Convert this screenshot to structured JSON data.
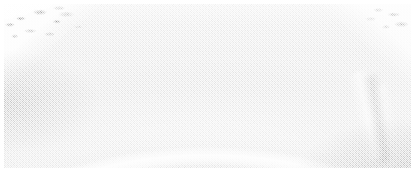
{
  "image": {
    "kind": "grayscale-noisy-micrograph",
    "width_px": 415,
    "height_px": 171,
    "border_color": "#ffffff",
    "border_px": 4,
    "alt": "Noisy grayscale image showing a broad dark dome bounded by a bright curved rim, with a secondary bright arc band below it and two thin bright streaks at right",
    "caption": ""
  },
  "tones": {
    "background_paper": "#ffffff",
    "outer_field_light": "#e8e8e8",
    "top_strip": "#c2c2c2",
    "dome_dark": "#909090",
    "dome_mid": "#9a9a9a",
    "arc_bright": "#dcdcdc",
    "basin_light": "#b2b2b2",
    "lower_field": "#a6a6a6",
    "streak_bright": "#d4d4d4"
  },
  "features": [
    {
      "name": "outer-rim-arc",
      "description": "Bright high-contrast curved rim sweeping from lower-left, over the top, to lower-right",
      "tone": "#f2f2f2"
    },
    {
      "name": "dark-dome",
      "description": "Large darker gray dome occupying the upper-centre of the frame",
      "tone": "#909090"
    },
    {
      "name": "inner-bright-arc",
      "description": "Secondary bright arc band with apex near centre, descending to both sides",
      "tone": "#dcdcdc"
    },
    {
      "name": "right-streak-primary",
      "description": "Thin bright lineation angled down-right in the right half",
      "tone": "#d4d4d4"
    },
    {
      "name": "right-streak-secondary",
      "description": "Fainter parallel lineation just right of the primary streak",
      "tone": "#c8c8c8"
    },
    {
      "name": "corner-mottle",
      "description": "Speckled light texture in the top-left and top-right corners outside the rim",
      "tone": "#e0e0e0"
    }
  ],
  "noise": {
    "type": "salt-and-pepper",
    "strength": "high",
    "grain_px": 1
  }
}
